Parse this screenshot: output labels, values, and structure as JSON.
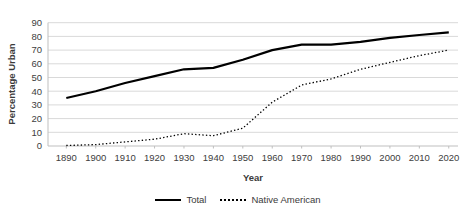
{
  "colors": {
    "line": "#000000",
    "gridline": "#d9d9d9",
    "axis": "#bfbfbf",
    "label": "#404040",
    "title": "#3a3a3a",
    "background": "#ffffff"
  },
  "chart_data": {
    "type": "line",
    "title": "",
    "xlabel": "Year",
    "ylabel": "Percentage Urban",
    "x": [
      1890,
      1900,
      1910,
      1920,
      1930,
      1940,
      1950,
      1960,
      1970,
      1980,
      1990,
      2000,
      2010,
      2020
    ],
    "ylim": [
      0,
      90
    ],
    "ytick_step": 10,
    "grid": "horizontal",
    "legend_position": "bottom-center",
    "series": [
      {
        "name": "Total",
        "style": "solid",
        "color": "#000000",
        "values": [
          35,
          40,
          46,
          51,
          56,
          57,
          63,
          70,
          74,
          74,
          76,
          79,
          81,
          83
        ]
      },
      {
        "name": "Native American",
        "style": "dotted",
        "color": "#000000",
        "values": [
          0.4,
          1,
          3,
          5,
          9,
          7.5,
          13,
          32,
          44.5,
          49,
          56,
          61,
          66,
          70
        ]
      }
    ]
  }
}
